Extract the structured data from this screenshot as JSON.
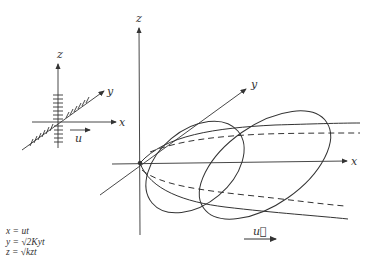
{
  "small_diagram": {
    "axis_labels": {
      "x": "x",
      "y": "y",
      "z": "z"
    },
    "flow_label": "u"
  },
  "main_diagram": {
    "axis_labels": {
      "x": "x",
      "y": "y",
      "z": "z"
    },
    "flow_label": "u⃗",
    "shape": "plume envelope with two elliptical cross-sections",
    "line_color": "#333333"
  },
  "equations": [
    "x = ut",
    "y = √2Kyt",
    "z = √kzt"
  ]
}
